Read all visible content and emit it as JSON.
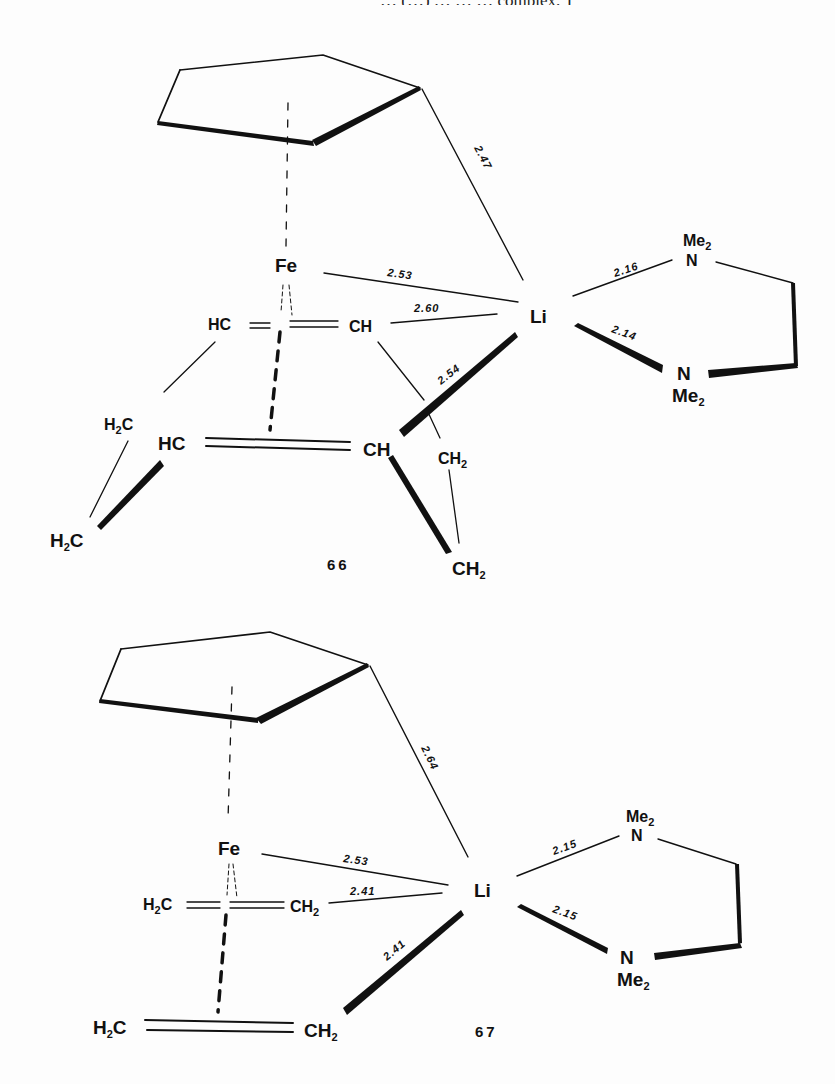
{
  "page": {
    "top_text_fragment": "… (…) … … … complex. T"
  },
  "structures": [
    {
      "id": "66",
      "label": "66",
      "metal": "Fe",
      "lithium": "Li",
      "upper_diene": {
        "left": "HC",
        "right": "CH"
      },
      "lower_diene": {
        "left": "HC",
        "right": "CH"
      },
      "left_bridge": {
        "upper": "H2C",
        "lower": "H2C",
        "upper_main": "H",
        "upper_sub": "2",
        "upper_tail": "C",
        "lower_main": "H",
        "lower_sub": "2",
        "lower_tail": "C"
      },
      "right_bridge": {
        "upper_main": "CH",
        "upper_sub": "2",
        "lower_main": "CH",
        "lower_sub": "2"
      },
      "amine_top": {
        "atom": "N",
        "group_main": "Me",
        "group_sub": "2"
      },
      "amine_bottom": {
        "atom": "N",
        "group_main": "Me",
        "group_sub": "2"
      },
      "distances": {
        "cp_li": "2.47",
        "fe_li": "2.53",
        "ch_li": "2.60",
        "lower_ch_li": "2.54",
        "li_n_top": "2.16",
        "li_n_bottom": "2.14"
      }
    },
    {
      "id": "67",
      "label": "67",
      "metal": "Fe",
      "lithium": "Li",
      "upper_ethylene": {
        "left_main": "H",
        "left_sub": "2",
        "left_tail": "C",
        "right_main": "CH",
        "right_sub": "2"
      },
      "lower_ethylene": {
        "left_main": "H",
        "left_sub": "2",
        "left_tail": "C",
        "right_main": "CH",
        "right_sub": "2"
      },
      "amine_top": {
        "atom": "N",
        "group_main": "Me",
        "group_sub": "2"
      },
      "amine_bottom": {
        "atom": "N",
        "group_main": "Me",
        "group_sub": "2"
      },
      "distances": {
        "cp_li": "2.64",
        "fe_li": "2.53",
        "ch2_li": "2.41",
        "lower_ch2_li": "2.41",
        "li_n_top": "2.15",
        "li_n_bottom": "2.15"
      }
    }
  ]
}
